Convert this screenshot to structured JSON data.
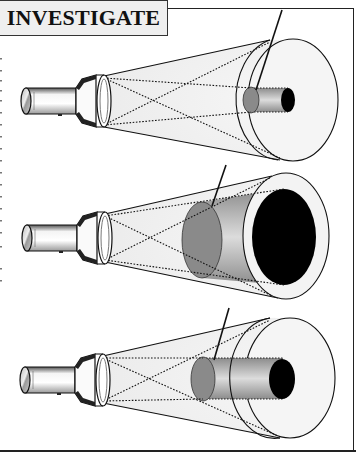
{
  "title": "INVESTIGATE",
  "colors": {
    "title_bg": "#efefef",
    "frame": "#222222",
    "beam": "#f2f2f2",
    "target_grey": "#8a8a8a",
    "tube_dark": "#9a9a9a",
    "tube_light": "#d8d8d8",
    "hole": "#000000"
  },
  "panels": [
    {
      "id": "panel-1",
      "description": "Flashlight beam cone with small-diameter tube ending in small black opening",
      "tube_size": "small",
      "pointer": "line pointing to grey end of tube"
    },
    {
      "id": "panel-2",
      "description": "Flashlight beam cone with large-diameter tube filling cone, large black opening",
      "tube_size": "large",
      "pointer": "line pointing to grey end of tube"
    },
    {
      "id": "panel-3",
      "description": "Flashlight beam cone with medium-diameter tube ending in medium black opening",
      "tube_size": "medium",
      "pointer": "line pointing to grey end of tube"
    }
  ]
}
